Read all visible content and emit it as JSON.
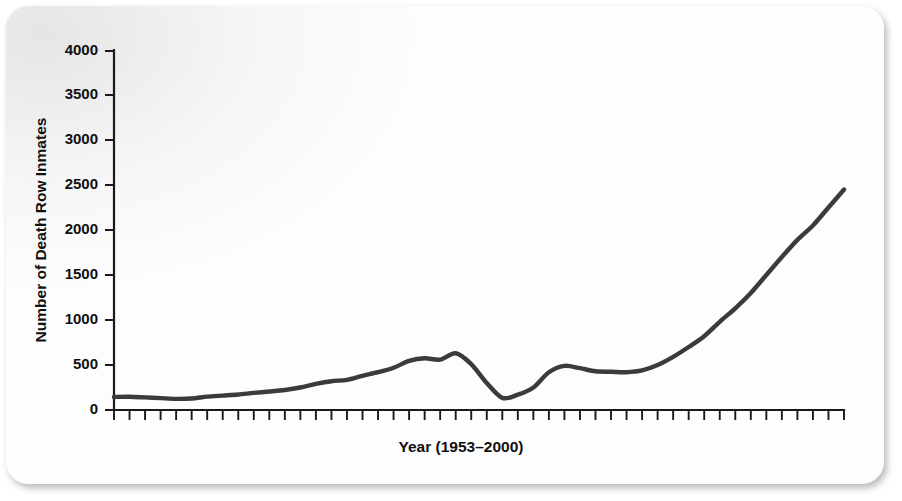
{
  "figure": {
    "background_color": "#fdfdfd",
    "line_color": "#3b3b3b",
    "axis_color": "#1a1a1a"
  },
  "chart_data": {
    "type": "line",
    "title": "",
    "xlabel": "Year (1953–2000)",
    "ylabel": "Number of Death Row Inmates",
    "xlim": [
      1953,
      2000
    ],
    "ylim": [
      0,
      4000
    ],
    "grid": false,
    "legend": null,
    "ytick_labels": [
      "0",
      "500",
      "1000",
      "1500",
      "2000",
      "2500",
      "3000",
      "3500",
      "4000"
    ],
    "ytick_values": [
      0,
      500,
      1000,
      1500,
      2000,
      2500,
      3000,
      3500,
      4000
    ],
    "xtick_count": 48,
    "xtick_labels": [],
    "x": [
      1953,
      1954,
      1955,
      1956,
      1957,
      1958,
      1959,
      1960,
      1961,
      1962,
      1963,
      1964,
      1965,
      1966,
      1967,
      1968,
      1969,
      1970,
      1971,
      1972,
      1973,
      1974,
      1975,
      1976,
      1977,
      1978,
      1979,
      1980,
      1981,
      1982,
      1983,
      1984,
      1985,
      1986,
      1987,
      1988,
      1989,
      1990,
      1991,
      1992,
      1993,
      1994,
      1995,
      1996,
      1997,
      1998,
      1999,
      2000
    ],
    "series": [
      {
        "name": "Number of Death Row Inmates",
        "values": [
          145,
          147,
          140,
          132,
          124,
          128,
          148,
          160,
          172,
          190,
          205,
          222,
          250,
          290,
          320,
          335,
          380,
          420,
          470,
          545,
          575,
          560,
          630,
          510,
          300,
          135,
          170,
          250,
          420,
          490,
          465,
          430,
          425,
          420,
          440,
          500,
          590,
          700,
          820,
          980,
          1130,
          1300,
          1500,
          1700,
          1890,
          2050,
          2250,
          2450
        ]
      }
    ]
  },
  "curve_points_px": "trace rendered from normalized path"
}
